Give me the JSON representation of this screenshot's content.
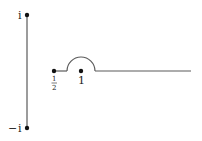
{
  "diagram": {
    "type": "contour",
    "colors": {
      "line": "#5a5a5a",
      "point": "#111111",
      "text": "#222222",
      "background": "#ffffff"
    },
    "labels": {
      "top_point": "i",
      "bottom_point_sign": "−",
      "bottom_point": "i",
      "half_num": "1",
      "half_den": "2",
      "one": "1"
    },
    "points": [
      {
        "name": "i",
        "x": 27,
        "y": 15
      },
      {
        "name": "-i",
        "x": 27,
        "y": 128
      },
      {
        "name": "1/2",
        "x": 54,
        "y": 71
      },
      {
        "name": "1",
        "x": 81,
        "y": 71
      }
    ],
    "segments": [
      {
        "name": "vertical-segment",
        "from": "i",
        "to": "-i"
      },
      {
        "name": "half-to-indent",
        "x1": 54,
        "x2": 67,
        "y": 71
      },
      {
        "name": "semicircle-indent",
        "cx": 81,
        "cy": 71,
        "r": 14
      },
      {
        "name": "ray-to-right",
        "x1": 95,
        "x2": 191,
        "y": 71
      }
    ]
  }
}
